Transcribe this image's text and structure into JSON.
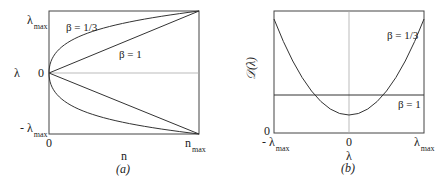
{
  "panel_a": {
    "caption": "(a)",
    "xlabel": "n",
    "ylabel": "λ",
    "x_ticks": [
      "0",
      "n",
      "max"
    ],
    "y_ticks": {
      "top": "λ",
      "top_sub": "max",
      "mid": "0",
      "bottom": "- λ",
      "bottom_sub": "max"
    },
    "x_tick_zero": "0",
    "x_tick_max": "n",
    "x_tick_max_sub": "max",
    "curves": [
      {
        "label": "β = 1/3",
        "shape": "power 1/3 (upper and lower branches)"
      },
      {
        "label": "β = 1",
        "shape": "linear (upper and lower branches)"
      }
    ]
  },
  "panel_b": {
    "caption": "(b)",
    "xlabel": "λ",
    "ylabel": "𝒟(λ)",
    "y_tick_zero": "0",
    "x_tick_min": "- λ",
    "x_tick_min_sub": "max",
    "x_tick_zero": "0",
    "x_tick_max": "λ",
    "x_tick_max_sub": "max",
    "curves": [
      {
        "label": "β = 1/3",
        "shape": "parabola"
      },
      {
        "label": "β = 1",
        "shape": "constant"
      }
    ]
  }
}
